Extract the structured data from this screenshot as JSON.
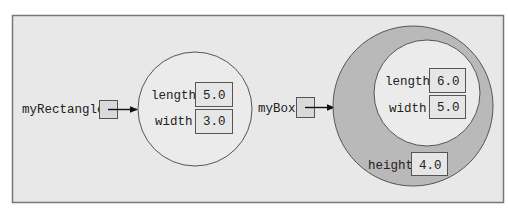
{
  "colors": {
    "frame_fill": "#e8e8e8",
    "frame_stroke": "#777777",
    "outer_ring_fill": "#b9b9b9",
    "inner_fill": "#ebebeb",
    "stroke": "#555555",
    "arrow": "#111111"
  },
  "rectangle_object": {
    "variable_name": "myRectangle",
    "fields": [
      {
        "name": "length",
        "value": "5.0"
      },
      {
        "name": "width",
        "value": "3.0"
      }
    ]
  },
  "box_object": {
    "variable_name": "myBox",
    "inherited_fields": [
      {
        "name": "length",
        "value": "6.0"
      },
      {
        "name": "width",
        "value": "5.0"
      }
    ],
    "own_fields": [
      {
        "name": "height",
        "value": "4.0"
      }
    ]
  }
}
